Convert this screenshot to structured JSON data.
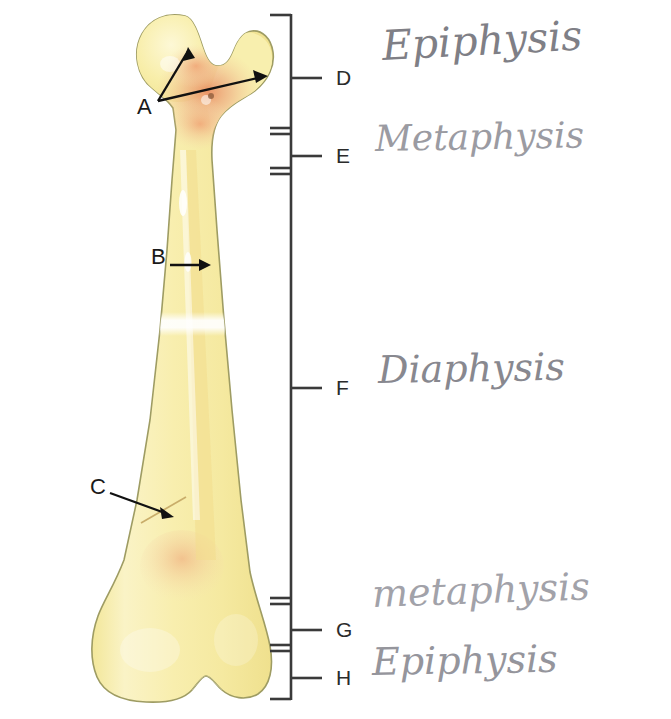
{
  "diagram": {
    "background_color": "#ffffff"
  },
  "bone": {
    "name": "femur",
    "outline_color": "#9a9a63",
    "fill_color": "#f7ec9e",
    "fill_color_light": "#fcf6cf",
    "marrow_color": "#f0c27a",
    "red_marrow_color": "#e8956b",
    "highlight_color": "#ffffff",
    "parts": [
      "head",
      "greater-trochanter",
      "neck",
      "shaft",
      "distal-condyles"
    ]
  },
  "callouts": [
    {
      "id": "A",
      "label": "A",
      "label_x": 137,
      "label_y": 105,
      "arrow_count": 2,
      "targets": [
        "femoral-head",
        "greater-trochanter"
      ]
    },
    {
      "id": "B",
      "label": "B",
      "label_x": 151,
      "label_y": 255,
      "arrow_count": 1,
      "targets": [
        "compact-bone-shaft"
      ]
    },
    {
      "id": "C",
      "label": "C",
      "label_x": 90,
      "label_y": 485,
      "arrow_count": 1,
      "targets": [
        "periosteum-line"
      ]
    }
  ],
  "regions": [
    {
      "id": "D",
      "letter": "D",
      "name": "Epiphysis",
      "handwritten_label": "Epiphysis",
      "letter_x": 340,
      "letter_y": 68,
      "tick_y": 78,
      "span_top": 14,
      "span_bottom": 131,
      "label_x": 382,
      "label_y": 22,
      "label_size": 41,
      "label_rotate": -3
    },
    {
      "id": "E",
      "letter": "E",
      "name": "Metaphysis",
      "handwritten_label": "Metaphysis",
      "letter_x": 340,
      "letter_y": 146,
      "tick_y": 156,
      "span_top": 131,
      "span_bottom": 171,
      "label_x": 375,
      "label_y": 118,
      "label_size": 36,
      "label_rotate": -1
    },
    {
      "id": "F",
      "letter": "F",
      "name": "Diaphysis",
      "handwritten_label": "Diaphysis",
      "letter_x": 340,
      "letter_y": 378,
      "tick_y": 388,
      "span_top": 171,
      "span_bottom": 601,
      "label_x": 378,
      "label_y": 348,
      "label_size": 38,
      "label_rotate": -1
    },
    {
      "id": "G",
      "letter": "G",
      "name": "Metaphysis",
      "handwritten_label": "metaphysis",
      "letter_x": 340,
      "letter_y": 620,
      "tick_y": 630,
      "span_top": 601,
      "span_bottom": 648,
      "label_x": 372,
      "label_y": 572,
      "label_size": 38,
      "label_rotate": -2
    },
    {
      "id": "H",
      "letter": "H",
      "name": "Epiphysis",
      "handwritten_label": "Epiphysis",
      "letter_x": 340,
      "letter_y": 668,
      "tick_y": 678,
      "span_top": 648,
      "span_bottom": 700,
      "label_x": 372,
      "label_y": 640,
      "label_size": 38,
      "label_rotate": -1
    }
  ],
  "bracket": {
    "line_color": "#3a3a3a",
    "spine_x": 291,
    "top_y": 14,
    "bottom_y": 700,
    "cap_length": 22,
    "tick_length": 26
  }
}
